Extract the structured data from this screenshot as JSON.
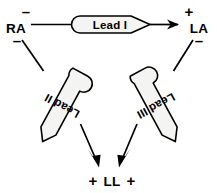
{
  "figure": {
    "name": "einthoven-triangle",
    "background_color": "#ffffff",
    "line_color": "#000000",
    "banner_fill_color": "#f4f4f2"
  },
  "nodes": [
    {
      "id": "ra",
      "label": "RA",
      "signs": [
        {
          "id": "ra-minus-top",
          "symbol": "–"
        },
        {
          "id": "ra-minus-bottom",
          "symbol": "–"
        }
      ]
    },
    {
      "id": "la",
      "label": "LA",
      "signs": [
        {
          "id": "la-plus-top",
          "symbol": "+"
        },
        {
          "id": "la-minus-bottom",
          "symbol": "–"
        }
      ]
    },
    {
      "id": "ll",
      "label": "LL",
      "signs": [
        {
          "id": "ll-plus-left",
          "symbol": "+"
        },
        {
          "id": "ll-plus-right",
          "symbol": "+"
        }
      ]
    }
  ],
  "leads": [
    {
      "id": "lead-1",
      "label": "Lead I",
      "from": "RA",
      "to": "LA",
      "direction": "left-to-right",
      "text_orientation": "horizontal"
    },
    {
      "id": "lead-2",
      "label": "Lead II",
      "from": "RA",
      "to": "LL",
      "direction": "top-left-to-bottom",
      "text_orientation": "rotated-upside-down"
    },
    {
      "id": "lead-3",
      "label": "Lead III",
      "from": "LA",
      "to": "LL",
      "direction": "top-right-to-bottom",
      "text_orientation": "rotated-bottom-up"
    }
  ]
}
